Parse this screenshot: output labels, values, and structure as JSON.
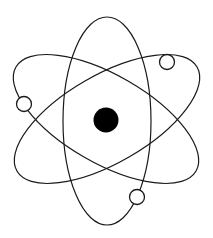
{
  "figure": {
    "title": "Atom symbol",
    "background_color": "#ffffff",
    "width": 213,
    "height": 238
  },
  "colors": {
    "stroke": "#1a1a1a",
    "nucleus_fill": "#000000",
    "electron_fill": "#ffffff",
    "background": "#ffffff"
  },
  "nucleus": {
    "label": "nucleus",
    "cx": 106,
    "cy": 120,
    "r": 12.5,
    "fill": "#000000"
  },
  "orbits": [
    {
      "label": "orbit-vertical",
      "cx": 107,
      "cy": 121,
      "rx": 44,
      "ry": 104,
      "rotation": 0,
      "stroke_width": 1.2
    },
    {
      "label": "orbit-diagonal-right",
      "cx": 107,
      "cy": 119,
      "rx": 44,
      "ry": 104,
      "rotation": 60,
      "stroke_width": 1.2
    },
    {
      "label": "orbit-diagonal-left",
      "cx": 106,
      "cy": 119,
      "rx": 44,
      "ry": 104,
      "rotation": -60,
      "stroke_width": 1.2
    }
  ],
  "electrons": [
    {
      "label": "electron-top-right",
      "cx": 167,
      "cy": 62,
      "r": 7.5
    },
    {
      "label": "electron-left",
      "cx": 24,
      "cy": 104,
      "r": 7.5
    },
    {
      "label": "electron-bottom-right",
      "cx": 137,
      "cy": 197,
      "r": 7.5
    }
  ]
}
